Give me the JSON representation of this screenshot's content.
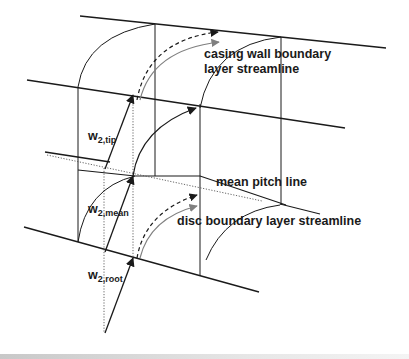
{
  "figure": {
    "labels": {
      "casing_line1": "casing wall boundary",
      "casing_line2": "layer streamline",
      "mean_pitch": "mean pitch line",
      "disc": "disc boundary layer streamline",
      "w_tip_main": "w",
      "w_tip_sub": "2,tip",
      "w_mean_main": "w",
      "w_mean_sub": "2,mean",
      "w_root_main": "w",
      "w_root_sub": "2,root"
    },
    "colors": {
      "line": "#1a1a1a",
      "grey_arrow": "#808080",
      "dotted": "#555555"
    }
  }
}
